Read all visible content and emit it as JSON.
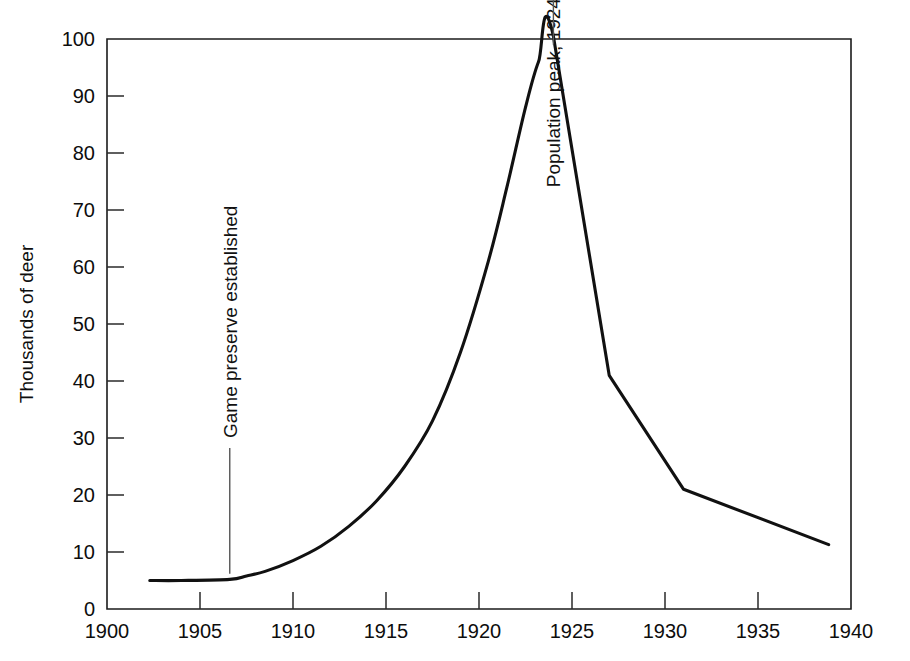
{
  "chart_data": {
    "type": "line",
    "title": "",
    "subtitle": "",
    "xlabel": "",
    "ylabel": "Thousands of deer",
    "xlim": [
      1900,
      1940
    ],
    "ylim": [
      0,
      100
    ],
    "grid": false,
    "legend": false,
    "legend_position": "none",
    "xticks": [
      1900,
      1905,
      1910,
      1915,
      1920,
      1925,
      1930,
      1935,
      1940
    ],
    "xtick_labels": [
      "1900",
      "1905",
      "1910",
      "1915",
      "1920",
      "1925",
      "1930",
      "1935",
      "1940"
    ],
    "yticks": [
      0,
      10,
      20,
      30,
      40,
      50,
      60,
      70,
      80,
      90,
      100
    ],
    "ytick_labels": [
      "0",
      "10",
      "20",
      "30",
      "40",
      "50",
      "60",
      "70",
      "80",
      "90",
      "100"
    ],
    "series": [
      {
        "name": "Kaibab deer population",
        "color": "#111111",
        "x": [
          1902.3,
          1904.0,
          1906.6,
          1907.5,
          1908.5,
          1910.0,
          1911.5,
          1913.0,
          1914.5,
          1916.0,
          1917.5,
          1919.0,
          1920.5,
          1921.5,
          1922.5,
          1923.2,
          1924.0,
          1927.0,
          1931.0,
          1938.8
        ],
        "y": [
          5.0,
          5.0,
          5.2,
          5.8,
          6.6,
          8.5,
          11.0,
          14.5,
          19.0,
          25.0,
          33.0,
          45.0,
          61.0,
          74.0,
          88.0,
          96.0,
          100.5,
          41.0,
          21.0,
          11.3
        ]
      }
    ],
    "annotations": [
      {
        "id": "game-preserve",
        "text": "Game preserve  established",
        "x": 1906.6,
        "y_text": 30,
        "orientation": "vertical",
        "leader": true
      },
      {
        "id": "population-peak",
        "text": "Population peak, 1924",
        "x": 1924.0,
        "y_text": 74,
        "orientation": "vertical",
        "leader": true
      }
    ]
  },
  "figure": {
    "background_color": "#ffffff",
    "axis_color": "#1b1b1b",
    "line_color": "#111111"
  }
}
